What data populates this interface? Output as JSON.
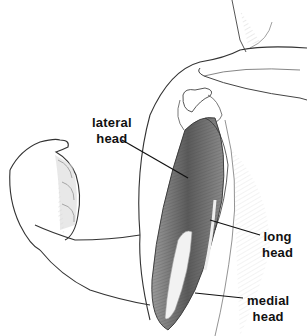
{
  "figure": {
    "labels": [
      {
        "id": "lateral",
        "lines": [
          "lateral",
          "head"
        ]
      },
      {
        "id": "long",
        "lines": [
          "long",
          "head"
        ]
      },
      {
        "id": "medial",
        "lines": [
          "medial",
          "head"
        ]
      }
    ],
    "colors": {
      "ink": "#222222",
      "muscle_dark": "#555555",
      "muscle_mid": "#8a8a8a",
      "shade": "#cfcfcf",
      "background": "#ffffff"
    }
  }
}
